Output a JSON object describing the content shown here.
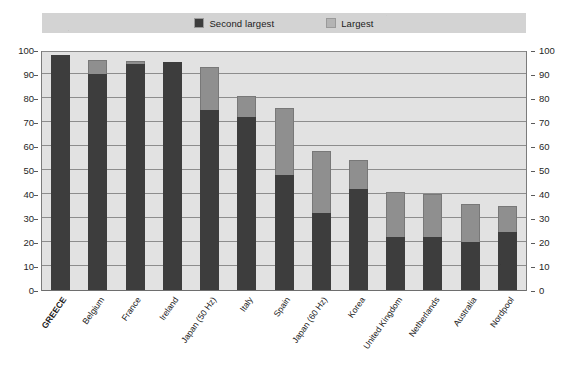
{
  "legend": {
    "position": "top-center",
    "entries": [
      {
        "label": "Second largest",
        "color": "#3d3d3d",
        "key": "second_largest"
      },
      {
        "label": "Largest",
        "color": "#8f8f8f",
        "key": "largest"
      }
    ]
  },
  "axes": {
    "left_ticks": [
      "100",
      "90",
      "80",
      "70",
      "60",
      "50",
      "40",
      "30",
      "20",
      "10",
      "0"
    ],
    "right_ticks": [
      "100",
      "90",
      "80",
      "70",
      "60",
      "50",
      "40",
      "30",
      "20",
      "10",
      "0"
    ]
  },
  "colors": {
    "second_largest": "#3d3d3d",
    "largest": "#8f8f8f",
    "plot_background": "#e2e2e2",
    "legend_background": "#d3d3d3",
    "gridline": "#8d8d8d",
    "page_background": "#ffffff"
  },
  "highlight_category": "GREECE",
  "chart_data": {
    "type": "bar",
    "stacked": true,
    "title": "",
    "subtitle": "",
    "xlabel": "",
    "ylabel": "",
    "ylim": [
      0,
      100
    ],
    "ytick_step": 10,
    "grid": true,
    "legend_position": "top-center",
    "dual_y_axis": true,
    "categories": [
      "GREECE",
      "Belgium",
      "France",
      "Ireland",
      "Japan (50 Hz)",
      "Italy",
      "Spain",
      "Japan (60 Hz)",
      "Korea",
      "United Kingdom",
      "Netherlands",
      "Australia",
      "Nordpool"
    ],
    "series": [
      {
        "name": "Second largest",
        "color": "#3d3d3d",
        "values": [
          98,
          90,
          94,
          95,
          75,
          72,
          48,
          32,
          42,
          22,
          22,
          20,
          24
        ]
      },
      {
        "name": "Largest",
        "color": "#8f8f8f",
        "values": [
          0,
          6,
          1.5,
          0,
          18,
          9,
          28,
          26,
          12,
          19,
          18,
          16,
          11
        ]
      }
    ],
    "totals": [
      98,
      96,
      95.5,
      95,
      93,
      81,
      76,
      58,
      54,
      41,
      40,
      36,
      35
    ]
  }
}
